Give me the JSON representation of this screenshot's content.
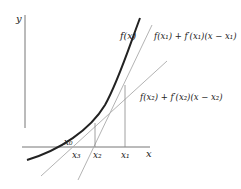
{
  "diagram": {
    "axes": {
      "x_label": "x",
      "y_label": "y"
    },
    "curve": {
      "label": "f(x)",
      "color": "#222222"
    },
    "tangents": [
      {
        "label": "f(x₁) + f′(x₁)(x − x₁)",
        "color": "#aaaaaa"
      },
      {
        "label": "f(x₂) + f′(x₂)(x − x₂)",
        "color": "#aaaaaa"
      }
    ],
    "points": {
      "x0": "x₀",
      "x1": "x₁",
      "x2": "x₂",
      "x3": "x₃"
    },
    "colors": {
      "axis": "#777777",
      "curve": "#222222",
      "tangent": "#aaaaaa",
      "guide": "#888888"
    }
  }
}
